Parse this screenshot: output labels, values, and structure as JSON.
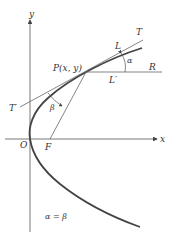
{
  "figure": {
    "type": "parabola-reflection-diagram",
    "labels": {
      "y_axis": "y",
      "x_axis": "x",
      "origin": "O",
      "focus": "F",
      "point": "P(x, y)",
      "tangent_end": "T",
      "tangent_start": "T′",
      "horizontal_end": "R",
      "point_L": "L",
      "point_L_prime": "L′",
      "angle_alpha": "α",
      "angle_beta": "β",
      "equation": "α = β"
    },
    "colors": {
      "curve": "#444444",
      "lines": "#666666",
      "text": "#333333"
    }
  }
}
